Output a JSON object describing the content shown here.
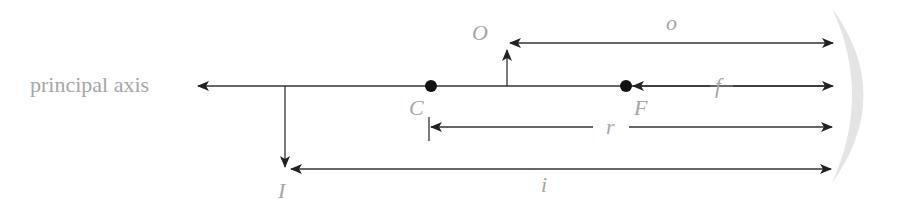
{
  "diagram": {
    "axis_label": "principal axis",
    "points": {
      "center_of_curvature": "C",
      "focal_point": "F"
    },
    "objects": {
      "object": "O",
      "image": "I"
    },
    "distances": {
      "object_distance": "o",
      "focal_length": "f",
      "radius": "r",
      "image_distance": "i"
    },
    "colors": {
      "line": "#333333",
      "label": "#a6a6a6",
      "mirror": "#e4e4e4"
    }
  }
}
